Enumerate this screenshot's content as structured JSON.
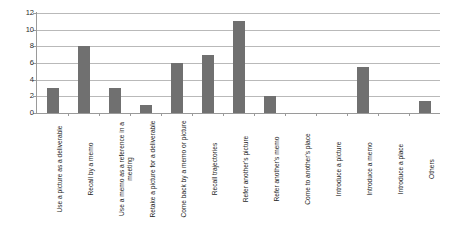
{
  "chart_data": {
    "type": "bar",
    "title": "",
    "subtitle": "",
    "xlabel": "",
    "ylabel": "",
    "ylim": [
      0,
      12
    ],
    "ytick_values": [
      0,
      2,
      4,
      6,
      8,
      10,
      12
    ],
    "ytick_labels": [
      "0",
      "2",
      "4",
      "6",
      "8",
      "10",
      "12"
    ],
    "grid": "horizontal",
    "legend": "none",
    "bar_color": "#707070",
    "gridline_color": "#b9b9b9",
    "axis_color": "#9a9a9a",
    "categories": [
      "Use a picture as a deliverable",
      "Recall by a memo",
      "Use a memo as a reference in a meeting",
      "Retake a picture for a deliverable",
      "Come back by a memo or picture",
      "Recall trajectories",
      "Refer another's picture",
      "Refer another's memo",
      "Come to another's place",
      "Introduce a picture",
      "Introduce a memo",
      "Introduce a place",
      "Others"
    ],
    "values": [
      3,
      8,
      3,
      1,
      6,
      7,
      11,
      2,
      0,
      0,
      5.5,
      0,
      1.5
    ]
  }
}
